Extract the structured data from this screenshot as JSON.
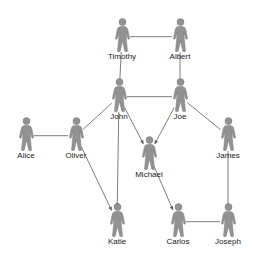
{
  "diagram": {
    "type": "social-network-graph",
    "title": "",
    "background_color": "#ffffff",
    "figure_color": "#929292",
    "figure_outline_color": "#7a7a7a",
    "edge_color": "#6e6e6e",
    "label_color": "#1a1a1a",
    "icon_name": "person-icon",
    "nodes": [
      {
        "id": "timothy",
        "label": "Timothy",
        "x": 122,
        "y": 18,
        "icon": "person-icon"
      },
      {
        "id": "albert",
        "label": "Albert",
        "x": 180,
        "y": 18,
        "icon": "person-icon"
      },
      {
        "id": "john",
        "label": "John",
        "x": 119,
        "y": 78,
        "icon": "person-icon"
      },
      {
        "id": "joe",
        "label": "Joe",
        "x": 180,
        "y": 78,
        "icon": "person-icon"
      },
      {
        "id": "alice",
        "label": "Alice",
        "x": 26,
        "y": 117,
        "icon": "person-icon"
      },
      {
        "id": "oliver",
        "label": "Oliver",
        "x": 76,
        "y": 117,
        "icon": "person-icon"
      },
      {
        "id": "michael",
        "label": "Michael",
        "x": 149,
        "y": 136,
        "icon": "person-icon"
      },
      {
        "id": "james",
        "label": "James",
        "x": 228,
        "y": 117,
        "icon": "person-icon"
      },
      {
        "id": "katie",
        "label": "Katie",
        "x": 117,
        "y": 203,
        "icon": "person-icon"
      },
      {
        "id": "carlos",
        "label": "Carlos",
        "x": 178,
        "y": 203,
        "icon": "person-icon"
      },
      {
        "id": "joseph",
        "label": "Joseph",
        "x": 228,
        "y": 203,
        "icon": "person-icon"
      }
    ],
    "edges": [
      {
        "from": "timothy",
        "to": "albert",
        "arrow": false
      },
      {
        "from": "timothy",
        "to": "john",
        "arrow": false
      },
      {
        "from": "albert",
        "to": "joe",
        "arrow": false
      },
      {
        "from": "john",
        "to": "joe",
        "arrow": false
      },
      {
        "from": "alice",
        "to": "oliver",
        "arrow": false
      },
      {
        "from": "oliver",
        "to": "john",
        "arrow": false
      },
      {
        "from": "joe",
        "to": "james",
        "arrow": false
      },
      {
        "from": "john",
        "to": "michael",
        "arrow": true
      },
      {
        "from": "joe",
        "to": "michael",
        "arrow": true
      },
      {
        "from": "oliver",
        "to": "katie",
        "arrow": true
      },
      {
        "from": "john",
        "to": "katie",
        "arrow": true
      },
      {
        "from": "michael",
        "to": "carlos",
        "arrow": true
      },
      {
        "from": "james",
        "to": "joseph",
        "arrow": false
      },
      {
        "from": "carlos",
        "to": "joseph",
        "arrow": false
      }
    ]
  }
}
